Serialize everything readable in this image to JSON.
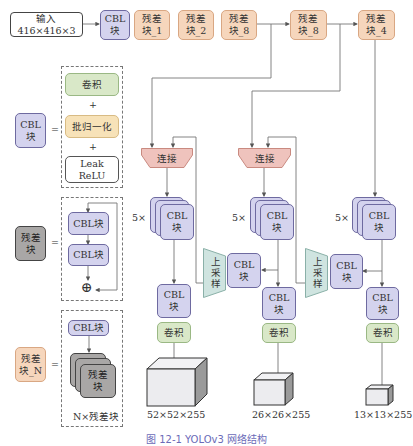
{
  "backbone": {
    "input": "输入\n416×416×3",
    "cbl": "CBL\n块",
    "res1": "残差\n块_1",
    "res2": "残差\n块_2",
    "res8a": "残差\n块_8",
    "res8b": "残差\n块_8",
    "res4": "残差\n块_4"
  },
  "legend": {
    "cbl": {
      "badge": "CBL\n块",
      "equals": "=",
      "conv": "卷积",
      "plus1": "+",
      "bn": "批归一化",
      "plus2": "+",
      "relu": "Leak\nReLU"
    },
    "res": {
      "badge": "残差\n块",
      "equals": "=",
      "cbl1": "CBL块",
      "cbl2": "CBL块",
      "add": "⊕"
    },
    "resN": {
      "badge": "残差\n块_N",
      "equals": "=",
      "cbl": "CBL块",
      "stack": "残差\n块",
      "label": "N×残差块"
    }
  },
  "heads": [
    {
      "concat": "连接",
      "repeat": "5×",
      "stack": "CBL\n块",
      "cbl": "CBL\n块",
      "conv": "卷积",
      "output": "52×52×255"
    },
    {
      "concat": "连接",
      "repeat": "5×",
      "stack": "CBL\n块",
      "cbl": "CBL\n块",
      "conv": "卷积",
      "output": "26×26×255"
    },
    {
      "repeat": "5×",
      "stack": "CBL\n块",
      "cbl": "CBL\n块",
      "conv": "卷积",
      "output": "13×13×255"
    }
  ],
  "upsample": [
    {
      "label": "上采样",
      "cbl": "CBL\n块"
    },
    {
      "label": "上采样",
      "cbl": "CBL\n块"
    }
  ],
  "caption": "图 12-1 YOLOv3 网络结构",
  "colors": {
    "cbl_fill": "#d4d3ee",
    "residual_fill": "#f6d6bc",
    "conv_fill": "#d9e8c8",
    "bn_fill": "#f7e2b8",
    "concat_fill": "#efc3bd",
    "upsample_fill": "#cfe4e0",
    "residual_gray": "#a9a7a6"
  }
}
